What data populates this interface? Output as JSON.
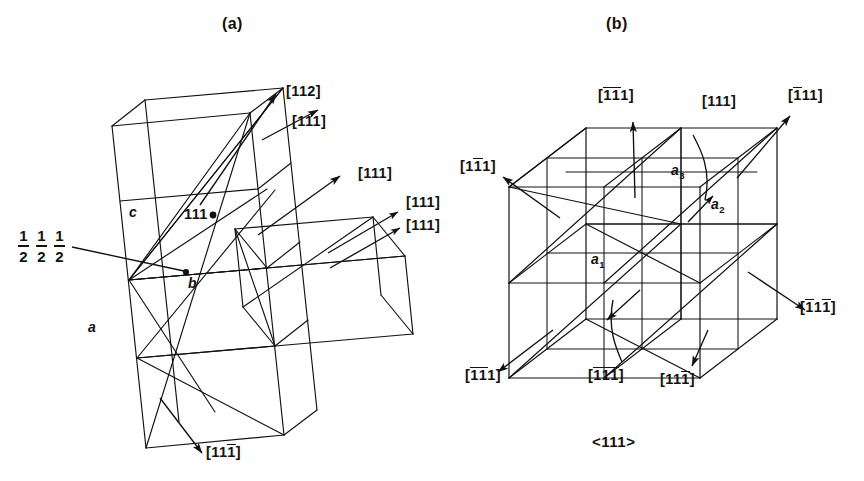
{
  "figure": {
    "background_color": "#ffffff",
    "ink_color": "#111111",
    "panels": [
      {
        "id": "a",
        "label": "(a)"
      },
      {
        "id": "b",
        "label": "(b)"
      }
    ],
    "caption": "<111>"
  },
  "panel_a": {
    "label": "(a)",
    "point_label": "111",
    "fraction_label": {
      "parts": [
        "1/2",
        "1/2",
        "1/2"
      ],
      "numerator": "1",
      "denominator": "2"
    },
    "axis_labels": [
      {
        "name": "a",
        "text": "a"
      },
      {
        "name": "b",
        "text": "b"
      },
      {
        "name": "c",
        "text": "c"
      }
    ],
    "direction_labels": [
      {
        "name": "dir-112-top",
        "text": "[112]",
        "digits": "112",
        "bars": []
      },
      {
        "name": "dir-111-top",
        "text": "[111]",
        "digits": "111",
        "bars": []
      },
      {
        "name": "dir-111-mid",
        "text": "[111]",
        "digits": "111",
        "bars": []
      },
      {
        "name": "dir-111-right-up",
        "text": "[111]",
        "digits": "111",
        "bars": []
      },
      {
        "name": "dir-111-right-low",
        "text": "[111]",
        "digits": "111",
        "bars": []
      },
      {
        "name": "dir-11-1bar-bottom",
        "text": "[111̄]",
        "digits": "111",
        "bars": [
          3
        ]
      }
    ]
  },
  "panel_b": {
    "label": "(b)",
    "caption": "<111>",
    "axis_labels": [
      {
        "name": "a1",
        "base": "a",
        "sub": "1"
      },
      {
        "name": "a2",
        "base": "a",
        "sub": "2"
      },
      {
        "name": "a3",
        "base": "a",
        "sub": "3"
      }
    ],
    "direction_labels": [
      {
        "name": "dir-1bar-1bar-1-top",
        "text": "[1̄1̄1]",
        "digits": "111",
        "bars": [
          1,
          2
        ]
      },
      {
        "name": "dir-111-top",
        "text": "[111]",
        "digits": "111",
        "bars": []
      },
      {
        "name": "dir-1bar-1-1-topright",
        "text": "[1̄11]",
        "digits": "111",
        "bars": [
          1
        ]
      },
      {
        "name": "dir-1-1bar-1-left",
        "text": "[11̄1]",
        "digits": "111",
        "bars": [
          2
        ]
      },
      {
        "name": "dir-1bar-1-1bar-right",
        "text": "[1̄11̄]",
        "digits": "111",
        "bars": [
          1,
          3
        ]
      },
      {
        "name": "dir-1bar-1bar-1-bottom",
        "text": "[1̄1̄1]",
        "digits": "111",
        "bars": [
          1,
          2
        ]
      },
      {
        "name": "dir-1bar-1bar-1bar",
        "text": "[1̄1̄1̄]",
        "digits": "111",
        "bars": [
          1,
          2,
          3
        ]
      },
      {
        "name": "dir-11-1bar-bottom",
        "text": "[111̄]",
        "digits": "111",
        "bars": [
          3
        ]
      }
    ]
  }
}
